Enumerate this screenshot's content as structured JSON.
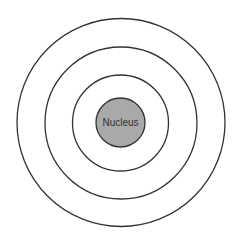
{
  "diagram": {
    "type": "atom-shell-model",
    "center": {
      "x": 120.5,
      "y": 122.5
    },
    "nucleus": {
      "label": "Nucleus",
      "radius": 24.5,
      "fill": "#a9a9a9",
      "stroke": "#333333"
    },
    "shells": [
      {
        "radius": 48,
        "stroke": "#333333"
      },
      {
        "radius": 76,
        "stroke": "#333333"
      },
      {
        "radius": 104,
        "stroke": "#333333"
      }
    ],
    "background": "#ffffff"
  }
}
